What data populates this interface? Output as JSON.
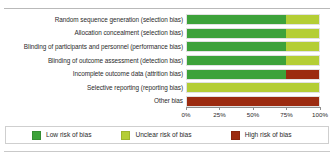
{
  "chart_data": {
    "type": "bar",
    "orientation": "horizontal",
    "stacked": true,
    "normalized": true,
    "title": "",
    "xlabel": "",
    "ylabel": "",
    "xlim": [
      0,
      100
    ],
    "grid": false,
    "legend_position": "bottom",
    "categories": [
      "Random sequence generation (selection bias)",
      "Allocation concealment (selection bias)",
      "Blinding of participants and personnel (performance bias)",
      "Blinding of outcome assessment (detection bias)",
      "Incomplete outcome data (attrition bias)",
      "Selective reporting (reporting bias)",
      "Other bias"
    ],
    "series": [
      {
        "name": "Low risk of bias",
        "color": "#3da23a",
        "values": [
          75,
          75,
          75,
          75,
          75,
          0,
          0
        ]
      },
      {
        "name": "Unclear risk of bias",
        "color": "#b4ce35",
        "values": [
          25,
          25,
          25,
          25,
          0,
          100,
          0
        ]
      },
      {
        "name": "High risk of bias",
        "color": "#9c2b10",
        "values": [
          0,
          0,
          0,
          0,
          25,
          0,
          100
        ]
      }
    ],
    "xticks": [
      0,
      25,
      50,
      75,
      100
    ],
    "xtick_labels": [
      "0%",
      "25%",
      "50%",
      "75%",
      "100%"
    ]
  },
  "legend": {
    "items": [
      {
        "label": "Low risk of bias",
        "color": "#3da23a"
      },
      {
        "label": "Unclear risk of bias",
        "color": "#b4ce35"
      },
      {
        "label": "High risk of bias",
        "color": "#9c2b10"
      }
    ]
  }
}
